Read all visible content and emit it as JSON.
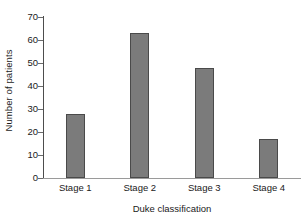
{
  "chart_data": {
    "type": "bar",
    "title": "",
    "subtitle": "",
    "xlabel": "Duke classification",
    "ylabel": "Number of patients",
    "categories": [
      "Stage 1",
      "Stage 2",
      "Stage 3",
      "Stage 4"
    ],
    "values": [
      28,
      63,
      48,
      17
    ],
    "series": [
      {
        "name": "Number of patients",
        "values": [
          28,
          63,
          48,
          17
        ]
      }
    ],
    "ylim": [
      0,
      70
    ],
    "yticks": [
      0,
      10,
      20,
      30,
      40,
      50,
      60,
      70
    ],
    "ytick_labels": [
      "0",
      "10",
      "20",
      "30",
      "40",
      "50",
      "60",
      "70"
    ],
    "grid": false,
    "legend": false,
    "legend_position": "none",
    "bar_color": "#7b7b7b",
    "bar_edge_color": "#4a4a4a",
    "axis_color": "#4d4d4d",
    "text_color": "#1a1a1a",
    "background": "#ffffff",
    "annotations": []
  }
}
